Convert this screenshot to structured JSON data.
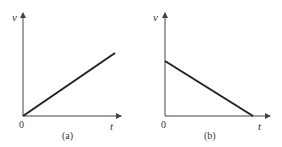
{
  "figure": {
    "panels": [
      {
        "id": "a",
        "caption": "(a)",
        "y_label": "v",
        "x_label": "t",
        "origin_label": "0",
        "line": "increasing from origin"
      },
      {
        "id": "b",
        "caption": "(b)",
        "y_label": "v",
        "x_label": "t",
        "origin_label": "0",
        "line": "decreasing from positive intercept to zero"
      }
    ],
    "colors": {
      "axis": "#444444",
      "line": "#222222",
      "text": "#333333"
    }
  }
}
